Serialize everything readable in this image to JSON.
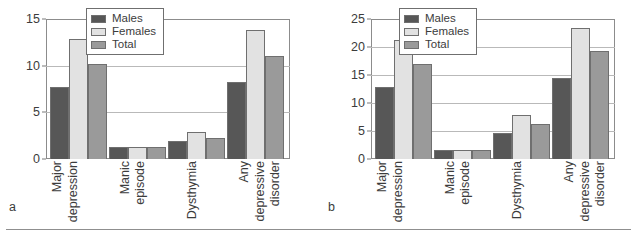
{
  "figure": {
    "panels": [
      {
        "letter": "a",
        "legend": [
          {
            "label": "Males",
            "swatch": "males",
            "color": "#575757"
          },
          {
            "label": "Females",
            "swatch": "females",
            "color": "#e2e2e2"
          },
          {
            "label": "Total",
            "swatch": "total",
            "color": "#9a9a9a"
          }
        ],
        "chart_data": {
          "type": "bar",
          "title": "",
          "xlabel": "",
          "ylabel": "",
          "ylim": [
            0,
            15
          ],
          "yticks": [
            0,
            5,
            10,
            15
          ],
          "grid": true,
          "legend_position": "top-center",
          "categories": [
            "Major depression",
            "Manic episode",
            "Dysthymia",
            "Any depressive disorder"
          ],
          "category_lines": [
            [
              "Major",
              "depression"
            ],
            [
              "Manic",
              "episode"
            ],
            [
              "Dysthymia"
            ],
            [
              "Any",
              "depressive",
              "disorder"
            ]
          ],
          "series": [
            {
              "name": "Males",
              "values": [
                7.7,
                1.3,
                1.9,
                8.3
              ]
            },
            {
              "name": "Females",
              "values": [
                12.9,
                1.3,
                2.9,
                13.8
              ]
            },
            {
              "name": "Total",
              "values": [
                10.2,
                1.3,
                2.3,
                11.0
              ]
            }
          ]
        }
      },
      {
        "letter": "b",
        "legend": [
          {
            "label": "Males",
            "swatch": "males",
            "color": "#575757"
          },
          {
            "label": "Females",
            "swatch": "females",
            "color": "#e2e2e2"
          },
          {
            "label": "Total",
            "swatch": "total",
            "color": "#9a9a9a"
          }
        ],
        "chart_data": {
          "type": "bar",
          "title": "",
          "xlabel": "",
          "ylabel": "",
          "ylim": [
            0,
            25
          ],
          "yticks": [
            0,
            5,
            10,
            15,
            20,
            25
          ],
          "grid": true,
          "legend_position": "top-center",
          "categories": [
            "Major depression",
            "Manic episode",
            "Dysthymia",
            "Any depressive disorder"
          ],
          "category_lines": [
            [
              "Major",
              "depression"
            ],
            [
              "Manic",
              "episode"
            ],
            [
              "Dysthymia"
            ],
            [
              "Any",
              "depressive",
              "disorder"
            ]
          ],
          "series": [
            {
              "name": "Males",
              "values": [
                12.8,
                1.6,
                4.7,
                14.4
              ]
            },
            {
              "name": "Females",
              "values": [
                21.2,
                1.6,
                7.8,
                23.4
              ]
            },
            {
              "name": "Total",
              "values": [
                17.0,
                1.6,
                6.2,
                19.2
              ]
            }
          ]
        }
      }
    ]
  }
}
